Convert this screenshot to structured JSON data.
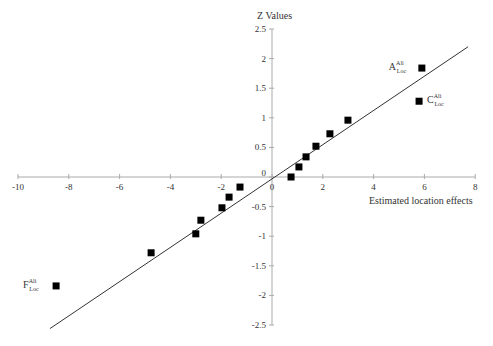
{
  "chart_data": {
    "type": "scatter",
    "title": "",
    "xlabel": "Estimated location effects",
    "ylabel": "Z Values",
    "xlim": [
      -10,
      8
    ],
    "ylim": [
      -2.5,
      2.5
    ],
    "x_ticks": [
      -10,
      -8,
      -6,
      -4,
      -2,
      0,
      2,
      4,
      6,
      8
    ],
    "y_ticks": [
      -2.5,
      -2,
      -1.5,
      -1,
      -0.5,
      0,
      0.5,
      1,
      1.5,
      2,
      2.5
    ],
    "x_tick_labels": [
      "-10",
      "-8",
      "-6",
      "-4",
      "-2",
      "0",
      "2",
      "4",
      "6",
      "8"
    ],
    "y_tick_labels": [
      "-2.5",
      "-2",
      "-1.5",
      "-1",
      "-0.5",
      "0",
      "0.5",
      "1",
      "1.5",
      "2",
      "2.5"
    ],
    "grid": false,
    "legend": null,
    "series": [
      {
        "name": "Effects",
        "marker": "square",
        "color": "#000000",
        "points": [
          {
            "x": -8.5,
            "y": -1.84,
            "label": "F",
            "sup": "Ali",
            "sub": "Loc"
          },
          {
            "x": -4.76,
            "y": -1.28
          },
          {
            "x": -3.0,
            "y": -0.96
          },
          {
            "x": -2.8,
            "y": -0.73
          },
          {
            "x": -1.97,
            "y": -0.52
          },
          {
            "x": -1.69,
            "y": -0.34
          },
          {
            "x": -1.26,
            "y": -0.17
          },
          {
            "x": 0.75,
            "y": 0.0
          },
          {
            "x": 1.06,
            "y": 0.17
          },
          {
            "x": 1.34,
            "y": 0.34
          },
          {
            "x": 1.73,
            "y": 0.52
          },
          {
            "x": 2.28,
            "y": 0.73
          },
          {
            "x": 2.99,
            "y": 0.96
          },
          {
            "x": 5.79,
            "y": 1.28,
            "label": "C",
            "sup": "Ali",
            "sub": "Loc"
          },
          {
            "x": 5.9,
            "y": 1.84,
            "label": "A",
            "sup": "Ali",
            "sub": "Loc"
          }
        ]
      }
    ],
    "reference_line": {
      "type": "line",
      "color": "#333333",
      "x": [
        -8.74,
        7.72
      ],
      "y": [
        -2.56,
        2.2
      ]
    },
    "annotations": [
      {
        "text": "A",
        "sup": "Ali",
        "sub": "Loc",
        "near_point": [
          5.9,
          1.84
        ],
        "position": "left"
      },
      {
        "text": "C",
        "sup": "Ali",
        "sub": "Loc",
        "near_point": [
          5.79,
          1.28
        ],
        "position": "right"
      },
      {
        "text": "F",
        "sup": "Ali",
        "sub": "Loc",
        "near_point": [
          -8.5,
          -1.84
        ],
        "position": "left"
      }
    ]
  },
  "axes": {
    "y_title": "Z Values",
    "x_title": "Estimated location effects"
  },
  "colors": {
    "axis": "#aaaaaa",
    "line": "#333333",
    "marker": "#000000",
    "text": "#333333"
  }
}
